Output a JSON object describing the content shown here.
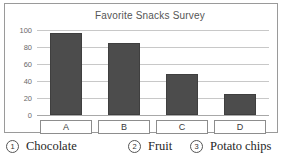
{
  "chart_data": {
    "type": "bar",
    "title": "Favorite Snacks Survey",
    "xlabel": "",
    "ylabel": "",
    "categories": [
      "A",
      "B",
      "C",
      "D"
    ],
    "values": [
      97,
      85,
      48,
      25
    ],
    "ylim": [
      0,
      100
    ],
    "yticks": [
      0,
      20,
      40,
      60,
      80,
      100
    ],
    "ytick_labels": [
      "0",
      "20",
      "40",
      "60",
      "80",
      "100"
    ],
    "grid": true,
    "legend": "none",
    "bar_color": "#4c4c4c",
    "gridline_color": "#c8c8c8",
    "axis_color": "#a8a8a8"
  },
  "options": [
    {
      "number": "1",
      "label": "Chocolate"
    },
    {
      "number": "2",
      "label": "Fruit"
    },
    {
      "number": "3",
      "label": "Potato chips"
    }
  ]
}
